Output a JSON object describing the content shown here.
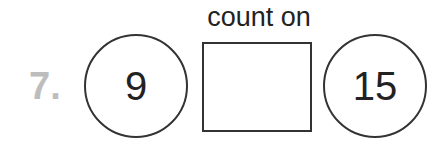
{
  "problem": {
    "number": "7.",
    "label": "count on",
    "start": "9",
    "answer_box": "",
    "end": "15"
  }
}
